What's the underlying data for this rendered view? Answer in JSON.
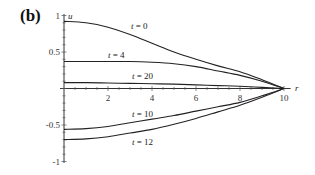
{
  "panel_label": "(b)",
  "chart_data": {
    "type": "line",
    "title": "",
    "xlabel": "r",
    "ylabel": "u",
    "xlim": [
      0,
      10
    ],
    "ylim": [
      -1,
      1
    ],
    "x_ticks": [
      2,
      4,
      6,
      8,
      10
    ],
    "y_ticks": [
      1,
      0.5,
      -0.5,
      -1
    ],
    "y_tick_labels": [
      "1",
      "0.5",
      "-0.5",
      "-1"
    ],
    "grid": false,
    "legend": "inline labels",
    "x": [
      0,
      1,
      2,
      3,
      4,
      5,
      6,
      7,
      8,
      9,
      10
    ],
    "series": [
      {
        "name": "t = 0",
        "values": [
          0.92,
          0.9,
          0.84,
          0.74,
          0.62,
          0.5,
          0.4,
          0.31,
          0.23,
          0.12,
          0.0
        ]
      },
      {
        "name": "t = 4",
        "values": [
          0.37,
          0.37,
          0.37,
          0.37,
          0.36,
          0.34,
          0.3,
          0.24,
          0.18,
          0.1,
          0.0
        ]
      },
      {
        "name": "t = 20",
        "values": [
          0.08,
          0.08,
          0.075,
          0.07,
          0.065,
          0.06,
          0.05,
          0.04,
          0.03,
          0.015,
          0.0
        ]
      },
      {
        "name": "t = 10",
        "values": [
          -0.56,
          -0.55,
          -0.52,
          -0.47,
          -0.42,
          -0.37,
          -0.31,
          -0.25,
          -0.19,
          -0.1,
          0.0
        ]
      },
      {
        "name": "t = 12",
        "values": [
          -0.7,
          -0.69,
          -0.66,
          -0.61,
          -0.56,
          -0.49,
          -0.41,
          -0.32,
          -0.23,
          -0.12,
          0.0
        ]
      }
    ]
  }
}
